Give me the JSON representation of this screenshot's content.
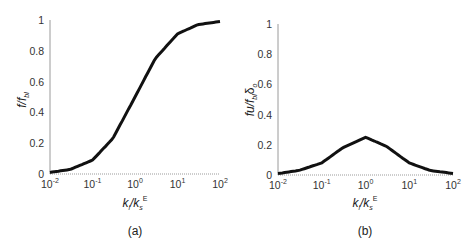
{
  "chart_data": [
    {
      "type": "line",
      "panel": "(a)",
      "caption": "(a)",
      "xlabel": "k_l/k_s^E",
      "ylabel": "f/f_bl",
      "xscale": "log",
      "xlim": [
        0.01,
        100
      ],
      "ylim": [
        0,
        1
      ],
      "xticks": [
        "10^-2",
        "10^-1",
        "10^0",
        "10^1",
        "10^2"
      ],
      "yticks": [
        "0",
        "0.2",
        "0.4",
        "0.6",
        "0.8",
        "1"
      ],
      "grid": false,
      "series": [
        {
          "name": "f/f_bl",
          "x": [
            0.01,
            0.03,
            0.1,
            0.3,
            1,
            3,
            10,
            30,
            100
          ],
          "values": [
            0.01,
            0.03,
            0.09,
            0.23,
            0.5,
            0.75,
            0.91,
            0.97,
            0.99
          ]
        }
      ]
    },
    {
      "type": "line",
      "panel": "(b)",
      "caption": "(b)",
      "xlabel": "k_l/k_s^E",
      "ylabel": "fu/f_bl δ_o",
      "xscale": "log",
      "xlim": [
        0.01,
        100
      ],
      "ylim": [
        0,
        1
      ],
      "xticks": [
        "10^-2",
        "10^-1",
        "10^0",
        "10^1",
        "10^2"
      ],
      "yticks": [
        "0",
        "0.2",
        "0.4",
        "0.6",
        "0.8",
        "1"
      ],
      "grid": false,
      "series": [
        {
          "name": "fu/f_bl δ_o",
          "x": [
            0.01,
            0.03,
            0.1,
            0.3,
            1,
            3,
            10,
            30,
            100
          ],
          "values": [
            0.01,
            0.03,
            0.08,
            0.18,
            0.25,
            0.19,
            0.08,
            0.03,
            0.01
          ]
        }
      ]
    }
  ],
  "panels": {
    "a": {
      "caption": "(a)",
      "ylabel_main": "f/f",
      "ylabel_sub": "bl",
      "xlabel_k1": "k",
      "xlabel_sub1": "l",
      "xlabel_k2": "/k",
      "xlabel_sub2": "s",
      "xlabel_sup2": "E"
    },
    "b": {
      "caption": "(b)",
      "ylabel_main": "fu/f",
      "ylabel_sub": "bl",
      "ylabel_delta": "δ",
      "ylabel_delta_sub": "o",
      "xlabel_k1": "k",
      "xlabel_sub1": "l",
      "xlabel_k2": "/k",
      "xlabel_sub2": "s",
      "xlabel_sup2": "E"
    }
  },
  "ticks": {
    "y": [
      "0",
      "0.2",
      "0.4",
      "0.6",
      "0.8",
      "1"
    ],
    "x_base": "10",
    "x_exp": [
      "-2",
      "-1",
      "0",
      "1",
      "2"
    ]
  },
  "colors": {
    "curve": "#111111",
    "axis": "#9a9a9a",
    "text": "#222222"
  }
}
